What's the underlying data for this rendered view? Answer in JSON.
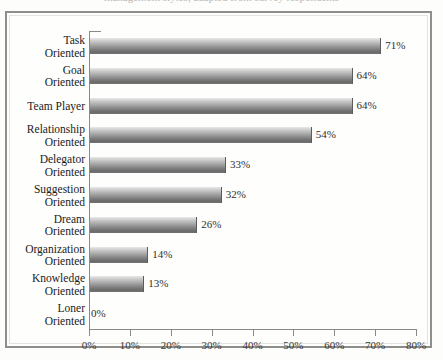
{
  "figure": {
    "caption_sliver": "management styles, adapted from survey respondents"
  },
  "chart_data": {
    "type": "bar",
    "orientation": "horizontal",
    "title": "",
    "xlabel": "",
    "ylabel": "",
    "xlim": [
      0,
      80
    ],
    "xtick_labels": [
      "0%",
      "10%",
      "20%",
      "30%",
      "40%",
      "50%",
      "60%",
      "70%",
      "80%"
    ],
    "xticks": [
      0,
      10,
      20,
      30,
      40,
      50,
      60,
      70,
      80
    ],
    "grid": false,
    "legend": false,
    "categories": [
      "Task Oriented",
      "Goal Oriented",
      "Team Player",
      "Relationship Oriented",
      "Delegator Oriented",
      "Suggestion Oriented",
      "Dream Oriented",
      "Organization Oriented",
      "Knowledge Oriented",
      "Loner Oriented"
    ],
    "category_lines": [
      [
        "Task",
        "Oriented"
      ],
      [
        "Goal",
        "Oriented"
      ],
      [
        "Team Player",
        ""
      ],
      [
        "Relationship",
        "Oriented"
      ],
      [
        "Delegator",
        "Oriented"
      ],
      [
        "Suggestion",
        "Oriented"
      ],
      [
        "Dream",
        "Oriented"
      ],
      [
        "Organization",
        "Oriented"
      ],
      [
        "Knowledge",
        "Oriented"
      ],
      [
        "Loner",
        "Oriented"
      ]
    ],
    "values": [
      71,
      64,
      64,
      54,
      33,
      32,
      26,
      14,
      13,
      0
    ],
    "value_labels": [
      "71%",
      "64%",
      "64%",
      "54%",
      "33%",
      "32%",
      "26%",
      "14%",
      "13%",
      "0%"
    ],
    "bar_color_top": "#e9e9e9",
    "bar_color_bottom": "#6a6a6a",
    "axis_color": "#8a8a87",
    "frame_color": "#8e8e8b",
    "background": "#fefefd"
  }
}
